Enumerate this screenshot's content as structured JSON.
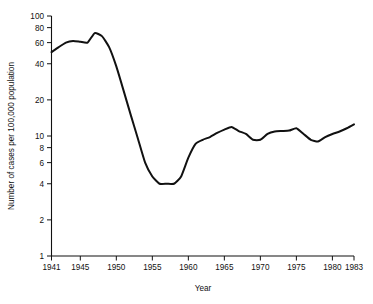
{
  "chart_data": {
    "type": "line",
    "title": "",
    "xlabel": "Year",
    "ylabel": "Number of cases per 100,000 population",
    "yscale": "log",
    "ylim": [
      1,
      100
    ],
    "xlim": [
      1941,
      1983
    ],
    "grid": false,
    "legend": null,
    "ytick_labels": [
      "100",
      "80",
      "60",
      "40",
      "20",
      "10",
      "8",
      "6",
      "4",
      "2",
      "1"
    ],
    "ytick_values": [
      100,
      80,
      60,
      40,
      20,
      10,
      8,
      6,
      4,
      2,
      1
    ],
    "xtick_labels": [
      "1941",
      "1945",
      "1950",
      "1955",
      "1960",
      "1965",
      "1970",
      "1975",
      "1980",
      "1983"
    ],
    "xtick_values": [
      1941,
      1945,
      1950,
      1955,
      1960,
      1965,
      1970,
      1975,
      1980,
      1983
    ],
    "series": [
      {
        "name": "Cases per 100,000 population",
        "x": [
          1941,
          1942,
          1943,
          1944,
          1945,
          1946,
          1947,
          1948,
          1949,
          1950,
          1951,
          1952,
          1953,
          1954,
          1955,
          1956,
          1957,
          1958,
          1959,
          1960,
          1961,
          1962,
          1963,
          1964,
          1965,
          1966,
          1967,
          1968,
          1969,
          1970,
          1971,
          1972,
          1973,
          1974,
          1975,
          1976,
          1977,
          1978,
          1979,
          1980,
          1981,
          1982,
          1983
        ],
        "y": [
          50,
          55,
          60,
          62,
          61,
          60,
          72,
          68,
          55,
          38,
          24,
          15,
          9.5,
          6.0,
          4.6,
          4.0,
          4.0,
          4.0,
          4.6,
          6.6,
          8.6,
          9.3,
          9.8,
          10.6,
          11.3,
          11.9,
          11.0,
          10.4,
          9.3,
          9.3,
          10.4,
          10.9,
          11.0,
          11.1,
          11.6,
          10.4,
          9.3,
          9.0,
          9.8,
          10.4,
          10.9,
          11.6,
          12.5
        ]
      }
    ]
  }
}
